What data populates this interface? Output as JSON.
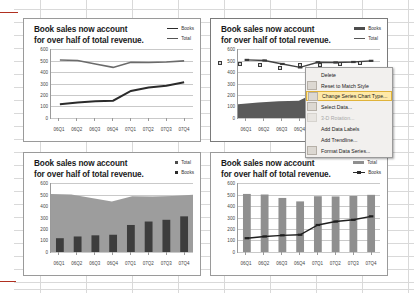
{
  "app": {
    "type": "spreadsheet",
    "accent_red": "#b03020",
    "grid_color": "#d9d9d9"
  },
  "charts": [
    {
      "id": "chart-tl",
      "position": "top-left",
      "title": "Book sales now account for over half of total revenue.",
      "title_line1": "Book sales now account",
      "title_line2": "for over half of total revenue.",
      "selected": false,
      "legend": [
        {
          "label": "Books",
          "marker": "line-dark"
        },
        {
          "label": "Total",
          "marker": "line"
        }
      ],
      "chart_data": {
        "type": "line",
        "title": "Book sales now account for over half of total revenue.",
        "categories": [
          "06Q1",
          "06Q2",
          "06Q3",
          "06Q4",
          "07Q1",
          "07Q2",
          "07Q3",
          "07Q4"
        ],
        "series": [
          {
            "name": "Total",
            "values": [
              505,
              500,
              470,
              440,
              485,
              483,
              487,
              497
            ]
          },
          {
            "name": "Books",
            "values": [
              120,
              135,
              145,
              150,
              235,
              265,
              280,
              310
            ]
          }
        ],
        "xlabel": "",
        "ylabel": "",
        "ylim": [
          0,
          600
        ],
        "yticks": [
          0,
          100,
          200,
          300,
          400,
          500,
          600
        ],
        "grid": true,
        "legend_position": "top-right"
      }
    },
    {
      "id": "chart-tr",
      "position": "top-right",
      "title": "Book sales now account for over half of total revenue.",
      "title_line1": "Book sales now account",
      "title_line2": "for over half of total revenue.",
      "selected": true,
      "legend": [
        {
          "label": "Books",
          "marker": "bar"
        },
        {
          "label": "Total",
          "marker": "line"
        }
      ],
      "chart_data": {
        "type": "area",
        "title": "Book sales now account for over half of total revenue.",
        "categories": [
          "06Q1",
          "06Q2",
          "06Q3",
          "06Q4",
          "07Q1",
          "07Q2",
          "07Q3",
          "07Q4"
        ],
        "series": [
          {
            "name": "Total",
            "values": [
              505,
              500,
              470,
              440,
              485,
              483,
              487,
              497
            ],
            "render": "line-markers"
          },
          {
            "name": "Books",
            "values": [
              120,
              135,
              145,
              150,
              235,
              265,
              280,
              310
            ],
            "render": "area"
          }
        ],
        "xlabel": "",
        "ylabel": "",
        "ylim": [
          0,
          600
        ],
        "yticks": [
          0,
          100,
          200,
          300,
          400,
          500,
          600
        ],
        "grid": true,
        "legend_position": "top-right"
      }
    },
    {
      "id": "chart-bl",
      "position": "bottom-left",
      "title": "Book sales now account for over half of total revenue.",
      "title_line1": "Book sales now account",
      "title_line2": "for over half of total revenue.",
      "selected": false,
      "legend": [
        {
          "label": "Total",
          "marker": "square"
        },
        {
          "label": "Books",
          "marker": "square-dark"
        }
      ],
      "chart_data": {
        "type": "area",
        "title": "Book sales now account for over half of total revenue.",
        "categories": [
          "06Q1",
          "06Q2",
          "06Q3",
          "06Q4",
          "07Q1",
          "07Q2",
          "07Q3",
          "07Q4"
        ],
        "series": [
          {
            "name": "Total",
            "values": [
              505,
              500,
              470,
              440,
              485,
              483,
              487,
              497
            ],
            "render": "area"
          },
          {
            "name": "Books",
            "values": [
              120,
              135,
              145,
              150,
              235,
              265,
              280,
              310
            ],
            "render": "column"
          }
        ],
        "xlabel": "",
        "ylabel": "",
        "ylim": [
          0,
          600
        ],
        "yticks": [
          0,
          100,
          200,
          300,
          400,
          500,
          600
        ],
        "grid": true,
        "legend_position": "top-right"
      }
    },
    {
      "id": "chart-br",
      "position": "bottom-right",
      "title": "Book sales now account for over half of total revenue.",
      "title_line1": "Book sales now account",
      "title_line2": "for over half of total revenue.",
      "selected": false,
      "legend": [
        {
          "label": "Total",
          "marker": "bar-light"
        },
        {
          "label": "Books",
          "marker": "line-markers"
        }
      ],
      "chart_data": {
        "type": "bar",
        "title": "Book sales now account for over half of total revenue.",
        "categories": [
          "06Q1",
          "06Q2",
          "06Q3",
          "06Q4",
          "07Q1",
          "07Q2",
          "07Q3",
          "07Q4"
        ],
        "series": [
          {
            "name": "Total",
            "values": [
              505,
              500,
              470,
              440,
              485,
              483,
              487,
              497
            ],
            "render": "column"
          },
          {
            "name": "Books",
            "values": [
              120,
              135,
              145,
              150,
              235,
              265,
              280,
              310
            ],
            "render": "line-markers"
          }
        ],
        "xlabel": "",
        "ylabel": "",
        "ylim": [
          0,
          600
        ],
        "yticks": [
          0,
          100,
          200,
          300,
          400,
          500,
          600
        ],
        "grid": true,
        "legend_position": "top-right"
      }
    }
  ],
  "context_menu": {
    "items": [
      {
        "label": "Delete",
        "icon": "none",
        "disabled": false,
        "highlighted": false
      },
      {
        "label": "Reset to Match Style",
        "icon": "reset-style-icon",
        "disabled": false,
        "highlighted": false
      },
      {
        "label": "Change Series Chart Type...",
        "icon": "chart-type-icon",
        "disabled": false,
        "highlighted": true
      },
      {
        "label": "Select Data...",
        "icon": "select-data-icon",
        "disabled": false,
        "highlighted": false
      },
      {
        "label": "3-D Rotation...",
        "icon": "rotation-icon",
        "disabled": true,
        "highlighted": false
      },
      {
        "label": "Add Data Labels",
        "icon": "none",
        "disabled": false,
        "highlighted": false
      },
      {
        "label": "Add Trendline...",
        "icon": "none",
        "disabled": false,
        "highlighted": false
      },
      {
        "label": "Format Data Series...",
        "icon": "format-icon",
        "disabled": false,
        "highlighted": false
      }
    ]
  }
}
